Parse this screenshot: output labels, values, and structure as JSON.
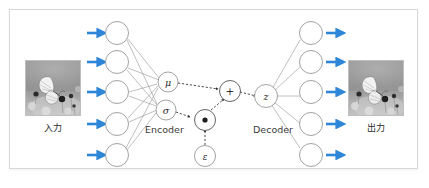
{
  "figure": {
    "frame": {
      "border_color": "#d8d8d8",
      "background": "#ffffff"
    }
  },
  "colors": {
    "arrow_blue": "#2e86d8",
    "node_stroke": "#8a8a8a",
    "edge_stroke": "#8a8a8a",
    "dashed_stroke": "#2b2b2b",
    "text": "#2b2b2b",
    "frame_border": "#d8d8d8"
  },
  "input_panel": {
    "label": "入力",
    "image_alt": "butterfly-grayscale-photo",
    "arrow_count": 5
  },
  "output_panel": {
    "label": "出力",
    "image_alt": "butterfly-grayscale-photo",
    "arrow_count": 5
  },
  "encoder": {
    "label": "Encoder",
    "input_node_count": 5,
    "latent_params": [
      {
        "name": "mu",
        "label": "μ"
      },
      {
        "name": "sigma",
        "label": "σ"
      }
    ]
  },
  "reparameterization": {
    "multiply_node": {
      "name": "elementwise-multiply",
      "label": "●"
    },
    "add_node": {
      "name": "add",
      "label": "+"
    },
    "noise_node": {
      "name": "epsilon",
      "label": "ε"
    }
  },
  "decoder": {
    "label": "Decoder",
    "latent_node": {
      "name": "z",
      "label": "z"
    },
    "output_node_count": 5
  }
}
